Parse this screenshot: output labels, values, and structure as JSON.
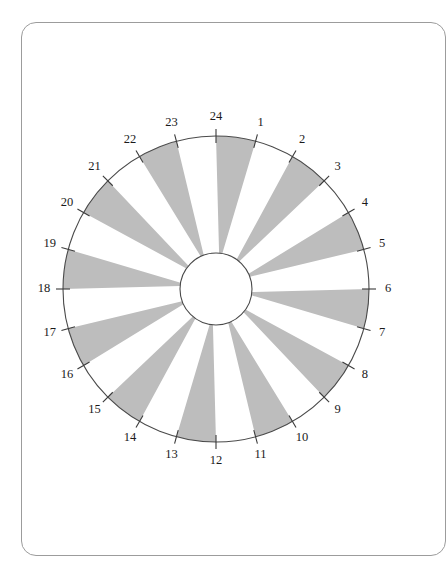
{
  "page": {
    "background_color": "#ffffff",
    "frame_border_color": "#9c9c9c"
  },
  "chart_data": {
    "type": "pie",
    "title": "",
    "subtitle": "",
    "xlabel": "",
    "ylabel": "",
    "legend_position": "none",
    "grid": false,
    "sector_count": 24,
    "sector_angle_degrees": 15,
    "categories": [
      "1",
      "2",
      "3",
      "4",
      "5",
      "6",
      "7",
      "8",
      "9",
      "10",
      "11",
      "12",
      "13",
      "14",
      "15",
      "16",
      "17",
      "18",
      "19",
      "20",
      "21",
      "22",
      "23",
      "24"
    ],
    "values": [
      15,
      15,
      15,
      15,
      15,
      15,
      15,
      15,
      15,
      15,
      15,
      15,
      15,
      15,
      15,
      15,
      15,
      15,
      15,
      15,
      15,
      15,
      15,
      15
    ],
    "tick_labels": [
      "1",
      "2",
      "3",
      "4",
      "5",
      "6",
      "7",
      "8",
      "9",
      "10",
      "11",
      "12",
      "13",
      "14",
      "15",
      "16",
      "17",
      "18",
      "19",
      "20",
      "21",
      "22",
      "23",
      "24"
    ],
    "fill_pattern": [
      "grey",
      "white",
      "grey",
      "white",
      "grey",
      "white",
      "grey",
      "white",
      "grey",
      "white",
      "grey",
      "white",
      "grey",
      "white",
      "grey",
      "white",
      "grey",
      "white",
      "grey",
      "white",
      "grey",
      "white",
      "grey",
      "white"
    ],
    "shaded_segments": [
      "1-2",
      "3-4",
      "5-6",
      "7-8",
      "9-10",
      "11-12",
      "13-14",
      "15-16",
      "17-18",
      "19-20",
      "21-22",
      "23-24"
    ],
    "unshaded_segments": [
      "2-3",
      "4-5",
      "6-7",
      "8-9",
      "10-11",
      "12-13",
      "14-15",
      "16-17",
      "18-19",
      "20-21",
      "22-23",
      "24-1"
    ],
    "colors": {
      "sector_fill": "#bdbdbd",
      "sector_blank": "#ffffff",
      "outline": "#4a4a4a",
      "tick": "#3a3a3a",
      "label": "#1a1a1a",
      "hub_fill": "#ffffff"
    },
    "geometry": {
      "center_x": 216,
      "center_y": 289,
      "outer_radius": 153,
      "inner_radius": 36,
      "tick_inner_radius": 146,
      "tick_outer_radius": 160,
      "label_radius": 172,
      "start_angle_degrees": -90,
      "direction": "clockwise"
    }
  }
}
